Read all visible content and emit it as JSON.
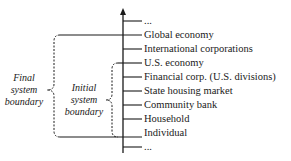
{
  "levels": [
    {
      "label": "...",
      "y": 21
    },
    {
      "label": "Global economy",
      "y": 35
    },
    {
      "label": "International corporations",
      "y": 49
    },
    {
      "label": "U.S. economy",
      "y": 63
    },
    {
      "label": "Financial corp. (U.S. divisions)",
      "y": 77
    },
    {
      "label": "State housing market",
      "y": 91
    },
    {
      "label": "Community bank",
      "y": 105
    },
    {
      "label": "Household",
      "y": 119
    },
    {
      "label": "Individual",
      "y": 133
    },
    {
      "label": "...",
      "y": 147
    }
  ],
  "boundaries": {
    "final": {
      "line1": "Final",
      "line2": "system",
      "line3": "boundary"
    },
    "initial": {
      "line1": "Initial",
      "line2": "system",
      "line3": "boundary"
    }
  },
  "colors": {
    "line": "#1a1a1a",
    "background": "#ffffff"
  }
}
